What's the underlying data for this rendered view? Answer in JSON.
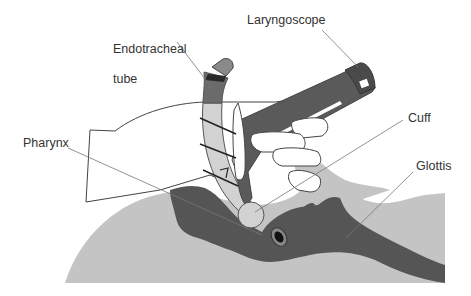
{
  "diagram": {
    "type": "anatomical illustration",
    "labels": {
      "endotracheal_tube_line1": "Endotracheal",
      "endotracheal_tube_line2": "tube",
      "laryngoscope": "Laryngoscope",
      "cuff": "Cuff",
      "pharynx": "Pharynx",
      "glottis": "Glottis"
    },
    "colors": {
      "background": "#ffffff",
      "tissue_light": "#c4c4c4",
      "tissue_dark": "#555555",
      "tube_dark": "#6b6b6b",
      "tube_light": "#d2d2d2",
      "laryngoscope": "#5a5a5a",
      "hand_fill": "#ffffff",
      "outline": "#444444",
      "leader_line": "#777777",
      "text": "#333333"
    }
  }
}
